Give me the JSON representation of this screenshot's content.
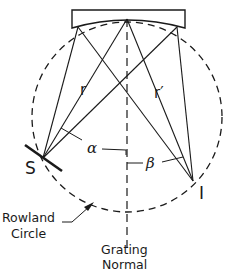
{
  "diagram": {
    "labels": {
      "source": "S",
      "image": "I",
      "r": "r",
      "r_prime": "r′",
      "alpha": "α",
      "beta": "β",
      "rowland_line1": "Rowland",
      "rowland_line2": "Circle",
      "normal_line1": "Grating",
      "normal_line2": "Normal"
    },
    "geometry": {
      "circle_center": [
        127,
        117
      ],
      "circle_radius": 95,
      "grating_vertex": [
        127,
        19
      ],
      "grating_left_edge": [
        78,
        27
      ],
      "grating_right_edge": [
        177,
        27
      ],
      "source_point": [
        43,
        158
      ],
      "image_point": [
        193,
        181
      ]
    },
    "colors": {
      "stroke": "#1a1a1a",
      "background": "#ffffff"
    }
  }
}
